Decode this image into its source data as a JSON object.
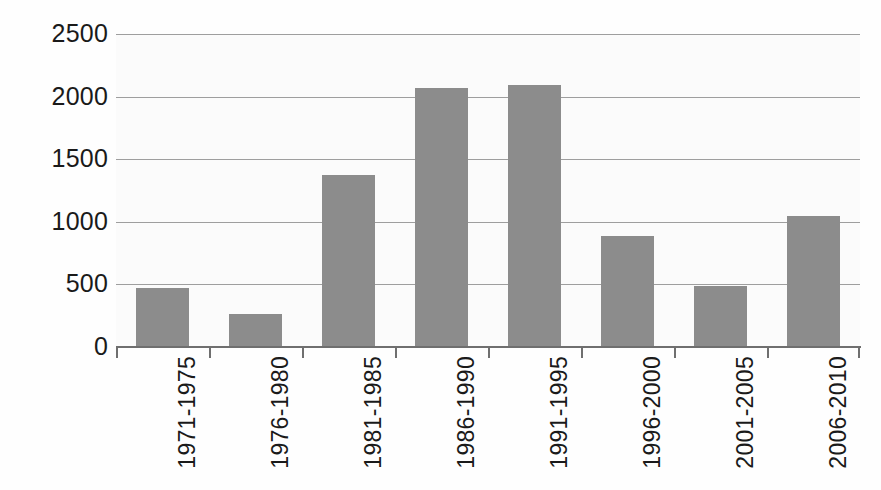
{
  "chart_data": {
    "type": "bar",
    "title": "",
    "subtitle": "",
    "xlabel": "",
    "ylabel": "",
    "categories": [
      "1971-1975",
      "1976-1980",
      "1981-1985",
      "1986-1990",
      "1991-1995",
      "1996-2000",
      "2001-2005",
      "2006-2010"
    ],
    "values": [
      470,
      265,
      1370,
      2070,
      2095,
      890,
      490,
      1050
    ],
    "series": [
      {
        "name": "Count",
        "values": [
          470,
          265,
          1370,
          2070,
          2095,
          890,
          490,
          1050
        ]
      }
    ],
    "ylim": [
      0,
      2500
    ],
    "yticks": [
      0,
      500,
      1000,
      1500,
      2000,
      2500
    ],
    "ytick_labels": [
      "0",
      "500",
      "1000",
      "1500",
      "2000",
      "2500"
    ],
    "grid": true,
    "grid_axis": "y",
    "legend": false,
    "legend_position": "none",
    "bar_color": "#8c8c8c",
    "gridline_color": "#8d8d8d",
    "axis_color": "#6f6f6f",
    "text_color": "#1a1a1a",
    "background_color": "#fbfbfb",
    "xtick_label_rotation": -90,
    "annotations": []
  }
}
